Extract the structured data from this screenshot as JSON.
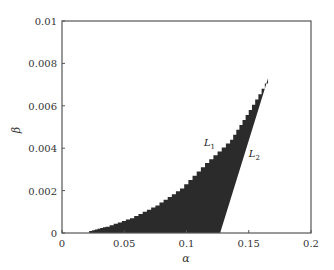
{
  "chart_data": {
    "type": "area",
    "title": "",
    "xlabel": "α",
    "ylabel": "β",
    "xlim": [
      0,
      0.2
    ],
    "ylim": [
      0,
      0.01
    ],
    "grid": false,
    "x_ticks": [
      "0",
      "0.05",
      "0.1",
      "0.15",
      "0.2"
    ],
    "y_ticks": [
      "0",
      "0.002",
      "0.004",
      "0.006",
      "0.008",
      "0.01"
    ],
    "fill_color": "#2b2b2b",
    "series": [
      {
        "name": "L1",
        "description": "left (curved) boundary of shaded region",
        "x": [
          0.022,
          0.035,
          0.0546,
          0.075,
          0.0948,
          0.1149,
          0.135,
          0.15,
          0.1655
        ],
        "y": [
          0.0001,
          0.0003,
          0.0007,
          0.0013,
          0.0021,
          0.0033,
          0.0044,
          0.0058,
          0.0073
        ]
      },
      {
        "name": "L2",
        "description": "right (straight) boundary of shaded region",
        "x": [
          0.127,
          0.1655
        ],
        "y": [
          0.0,
          0.0073
        ]
      }
    ],
    "annotations": [
      {
        "text": "L",
        "sub": "1",
        "x": 0.114,
        "y": 0.0041
      },
      {
        "text": "L",
        "sub": "2",
        "x": 0.15,
        "y": 0.0036
      }
    ]
  }
}
